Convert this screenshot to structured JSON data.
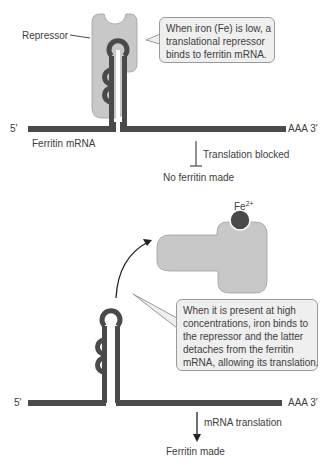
{
  "colors": {
    "mrna": "#4a4a4a",
    "repressor": "#c8c8c8",
    "iron": "#4a4a4a",
    "callout_bg": "#efefef",
    "callout_border": "#9a9a9a",
    "text": "#3d3d3d"
  },
  "top_panel": {
    "repressor_label": "Repressor",
    "callout_lines": [
      "When iron (Fe) is low, a",
      "translational repressor",
      "binds to ferritin mRNA."
    ],
    "five_prime": "5′",
    "three_prime": "AAA 3′",
    "mrna_label": "Ferritin mRNA",
    "blocked_label": "Translation blocked",
    "outcome": "No ferritin made"
  },
  "bottom_panel": {
    "iron_label": "Fe",
    "iron_charge": "2+",
    "callout_lines": [
      "When it is present at high",
      "concentrations, iron binds to",
      "the repressor and the latter",
      "detaches from the ferritin",
      "mRNA, allowing its translation."
    ],
    "five_prime": "5′",
    "three_prime": "AAA 3′",
    "translation_label": "mRNA translation",
    "outcome": "Ferritin made"
  }
}
